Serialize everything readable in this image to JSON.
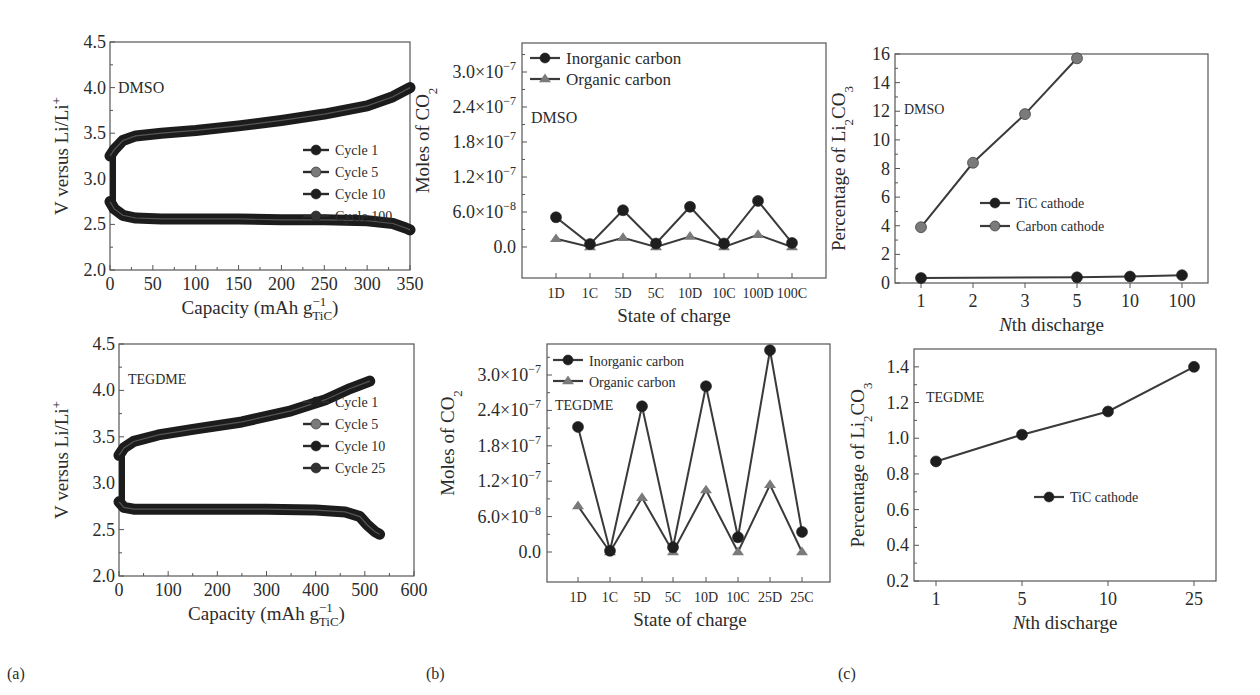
{
  "figure": {
    "panel_tags": [
      "(a)",
      "(b)",
      "(c)"
    ]
  },
  "colors": {
    "dark": "#1e1e1e",
    "gray": "#7a7a7a",
    "axis": "#555555",
    "line": "#3a3a3a"
  },
  "chart_data": [
    {
      "id": "a-top",
      "type": "line",
      "title": "",
      "annotation": "DMSO",
      "xlabel": "Capacity (mAh g",
      "xlabel_sup": "−1",
      "xlabel_sub": "TiC",
      "xlabel_tail": ")",
      "ylabel": "V versus Li/Li",
      "ylabel_sup": "+",
      "xlim": [
        0,
        350
      ],
      "ylim": [
        2.0,
        4.5
      ],
      "xticks": [
        "0",
        "50",
        "100",
        "150",
        "200",
        "250",
        "300",
        "350"
      ],
      "yticks": [
        "2.0",
        "2.5",
        "3.0",
        "3.5",
        "4.0",
        "4.5"
      ],
      "legend": [
        "Cycle 1",
        "Cycle 5",
        "Cycle 10",
        "Cycle 100"
      ],
      "legend_colors": [
        "#1e1e1e",
        "#7a7a7a",
        "#1e1e1e",
        "#333333"
      ],
      "series": [
        {
          "name": "Charge (all cycles)",
          "x": [
            0,
            5,
            15,
            30,
            60,
            100,
            150,
            200,
            250,
            300,
            330,
            350
          ],
          "y": [
            3.25,
            3.32,
            3.42,
            3.47,
            3.5,
            3.53,
            3.58,
            3.64,
            3.71,
            3.8,
            3.9,
            4.0
          ]
        },
        {
          "name": "Discharge (all cycles)",
          "x": [
            0,
            5,
            15,
            30,
            60,
            100,
            150,
            200,
            250,
            300,
            330,
            345,
            350
          ],
          "y": [
            2.75,
            2.67,
            2.6,
            2.57,
            2.56,
            2.56,
            2.56,
            2.55,
            2.55,
            2.54,
            2.51,
            2.46,
            2.44
          ]
        }
      ]
    },
    {
      "id": "a-bottom",
      "type": "line",
      "annotation": "TEGDME",
      "xlabel": "Capacity (mAh g",
      "xlabel_sup": "−1",
      "xlabel_sub": "TiC",
      "xlabel_tail": ")",
      "ylabel": "V versus Li/Li",
      "ylabel_sup": "+",
      "xlim": [
        0,
        600
      ],
      "ylim": [
        2.0,
        4.5
      ],
      "xticks": [
        "0",
        "100",
        "200",
        "300",
        "400",
        "500",
        "600"
      ],
      "yticks": [
        "2.0",
        "2.5",
        "3.0",
        "3.5",
        "4.0",
        "4.5"
      ],
      "legend": [
        "Cycle 1",
        "Cycle 5",
        "Cycle 10",
        "Cycle 25"
      ],
      "legend_colors": [
        "#1e1e1e",
        "#7a7a7a",
        "#1e1e1e",
        "#333333"
      ],
      "series": [
        {
          "name": "Charge (all cycles)",
          "x": [
            0,
            10,
            30,
            80,
            150,
            250,
            350,
            420,
            470,
            510
          ],
          "y": [
            3.3,
            3.38,
            3.45,
            3.52,
            3.58,
            3.66,
            3.78,
            3.9,
            4.02,
            4.1
          ]
        },
        {
          "name": "Discharge (all cycles)",
          "x": [
            0,
            10,
            30,
            100,
            200,
            300,
            400,
            460,
            490,
            505,
            520,
            530
          ],
          "y": [
            2.8,
            2.74,
            2.72,
            2.72,
            2.72,
            2.72,
            2.71,
            2.69,
            2.64,
            2.55,
            2.48,
            2.45
          ]
        }
      ]
    },
    {
      "id": "b-top",
      "type": "line",
      "annotation": "DMSO",
      "xlabel": "State of charge",
      "ylabel": "Moles of CO",
      "ylabel_sub": "2",
      "ylim": [
        -5e-08,
        3.3e-07
      ],
      "yticks": [
        "0.0",
        "6.0×10",
        "1.2×10",
        "1.8×10",
        "2.4×10",
        "3.0×10"
      ],
      "ytick_exps": [
        "",
        "−8",
        "−7",
        "−7",
        "−7",
        "−7"
      ],
      "categories": [
        "1D",
        "1C",
        "5D",
        "5C",
        "10D",
        "10C",
        "100D",
        "100C"
      ],
      "legend": [
        "Inorganic carbon",
        "Organic carbon"
      ],
      "series": [
        {
          "name": "Inorganic carbon",
          "marker": "circle",
          "values": [
            5.1e-08,
            5e-09,
            6.3e-08,
            6e-09,
            6.9e-08,
            6e-09,
            7.9e-08,
            7e-09
          ]
        },
        {
          "name": "Organic carbon",
          "marker": "triangle",
          "values": [
            1.4e-08,
            0.0,
            1.6e-08,
            0.0,
            1.8e-08,
            0.0,
            2.1e-08,
            0.0
          ]
        }
      ]
    },
    {
      "id": "b-bottom",
      "type": "line",
      "annotation": "TEGDME",
      "xlabel": "State of charge",
      "ylabel": "Moles of CO",
      "ylabel_sub": "2",
      "ylim": [
        -5e-08,
        3.5e-07
      ],
      "yticks": [
        "0.0",
        "6.0×10",
        "1.2×10",
        "1.8×10",
        "2.4×10",
        "3.0×10"
      ],
      "ytick_exps": [
        "",
        "−8",
        "−7",
        "−7",
        "−7",
        "−7"
      ],
      "categories": [
        "1D",
        "1C",
        "5D",
        "5C",
        "10D",
        "10C",
        "25D",
        "25C"
      ],
      "legend": [
        "Inorganic carbon",
        "Organic carbon"
      ],
      "series": [
        {
          "name": "Inorganic carbon",
          "marker": "circle",
          "values": [
            2.12e-07,
            2e-09,
            2.47e-07,
            8e-09,
            2.81e-07,
            2.5e-08,
            3.42e-07,
            3.4e-08
          ]
        },
        {
          "name": "Organic carbon",
          "marker": "triangle",
          "values": [
            7.8e-08,
            0.0,
            9.2e-08,
            0.0,
            1.05e-07,
            0.0,
            1.14e-07,
            0.0
          ]
        }
      ]
    },
    {
      "id": "c-top",
      "type": "line",
      "annotation": "DMSO",
      "xlabel": "th discharge",
      "xlabel_italic": "N",
      "ylabel": "Percentage of Li",
      "ylabel_sub": "2",
      "ylabel_tail": "CO",
      "ylabel_sub2": "3",
      "ylim": [
        0,
        16
      ],
      "yticks": [
        "0",
        "2",
        "4",
        "6",
        "8",
        "10",
        "12",
        "14",
        "16"
      ],
      "categories": [
        "1",
        "2",
        "3",
        "5",
        "10",
        "100"
      ],
      "legend": [
        "TiC cathode",
        "Carbon cathode"
      ],
      "series": [
        {
          "name": "TiC cathode",
          "color": "#1e1e1e",
          "x_index": [
            0,
            3,
            4,
            5
          ],
          "values": [
            0.35,
            0.4,
            0.45,
            0.55
          ]
        },
        {
          "name": "Carbon cathode",
          "color": "#7a7a7a",
          "x_index": [
            0,
            1,
            2,
            3
          ],
          "values": [
            3.9,
            8.4,
            11.8,
            15.7
          ]
        }
      ]
    },
    {
      "id": "c-bottom",
      "type": "line",
      "annotation": "TEGDME",
      "xlabel": "th discharge",
      "xlabel_italic": "N",
      "ylabel": "Percentage of Li",
      "ylabel_sub": "2",
      "ylabel_tail": "CO",
      "ylabel_sub2": "3",
      "ylim": [
        0.2,
        1.5
      ],
      "yticks": [
        "0.2",
        "0.4",
        "0.6",
        "0.8",
        "1.0",
        "1.2",
        "1.4"
      ],
      "categories": [
        "1",
        "5",
        "10",
        "25"
      ],
      "legend": [
        "TiC cathode"
      ],
      "series": [
        {
          "name": "TiC cathode",
          "color": "#1e1e1e",
          "x_index": [
            0,
            1,
            2,
            3
          ],
          "values": [
            0.87,
            1.02,
            1.15,
            1.4
          ]
        }
      ]
    }
  ]
}
